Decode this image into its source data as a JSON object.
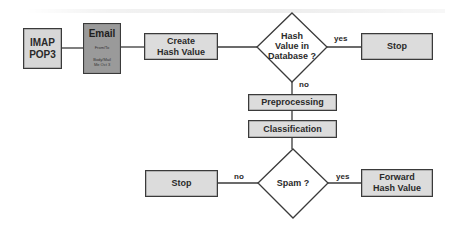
{
  "diagram": {
    "nodes": {
      "source": {
        "label_line1": "IMAP",
        "label_line2": "POP3"
      },
      "email": {
        "title": "Email",
        "field1": "From/To",
        "field2": "Body/Mail",
        "field3": "Me Oct 3"
      },
      "create_hash": {
        "label_line1": "Create",
        "label_line2": "Hash Value"
      },
      "hash_check": {
        "label_line1": "Hash",
        "label_line2": "Value in",
        "label_line3": "Database ?"
      },
      "stop_top": {
        "label": "Stop"
      },
      "preprocessing": {
        "label": "Preprocessing"
      },
      "classification": {
        "label": "Classification"
      },
      "spam_check": {
        "label": "Spam ?"
      },
      "stop_bottom": {
        "label": "Stop"
      },
      "forward": {
        "label_line1": "Forward",
        "label_line2": "Hash Value"
      }
    },
    "edges": {
      "hash_yes": "yes",
      "hash_no": "no",
      "spam_no": "no",
      "spam_yes": "yes"
    },
    "colors": {
      "box_fill": "#d9d9d9",
      "email_fill": "#9a9a9a",
      "stroke": "#3a3a3a"
    }
  }
}
